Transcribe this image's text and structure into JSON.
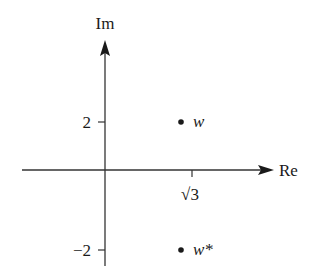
{
  "diagram": {
    "type": "complex-plane",
    "axes": {
      "x_label": "Re",
      "y_label": "Im",
      "x_ticks": [
        {
          "value": "√3",
          "label": "√3"
        }
      ],
      "y_ticks": [
        {
          "value": 2,
          "label": "2"
        },
        {
          "value": -2,
          "label": "−2"
        }
      ]
    },
    "points": [
      {
        "name": "w",
        "label": "w",
        "re": "√3",
        "im": 2
      },
      {
        "name": "w*",
        "label": "w*",
        "re": "√3",
        "im": -2
      }
    ]
  }
}
